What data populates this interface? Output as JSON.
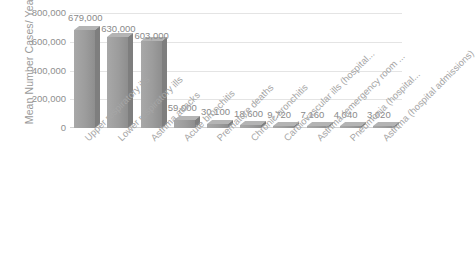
{
  "chart_data": {
    "type": "bar",
    "title": "",
    "xlabel": "",
    "ylabel": "Mean Number Cases/ Year",
    "ylim": [
      0,
      800000
    ],
    "grid": true,
    "legend": "none",
    "yticks": [
      "800,000",
      "600,000",
      "400,000",
      "200,000",
      "0"
    ],
    "ytick_values": [
      800000,
      600000,
      400000,
      200000,
      0
    ],
    "categories": [
      "Upper respiratory ills",
      "Lower respiratory ills",
      "Asthma attacks",
      "Acute bronchitis",
      "Premature deaths",
      "Chronic bronchitis",
      "Cardiovascular ills (hospital...",
      "Asthma (emergency room ...",
      "Pneumonia (hospital...",
      "Asthma (hospital admissions)"
    ],
    "values": [
      679000,
      630000,
      603000,
      59000,
      30100,
      18600,
      9720,
      7160,
      4040,
      3020
    ],
    "data_labels": [
      "679,000",
      "630,000",
      "603,000",
      "59,000",
      "30,100",
      "18,600",
      "9,720",
      "7,160",
      "4,040",
      "3,020"
    ],
    "bar_color": "#9e9e9e",
    "grid_color": "#e4e4e4",
    "text_color": "#8f8f8f",
    "background": "#ffffff"
  }
}
